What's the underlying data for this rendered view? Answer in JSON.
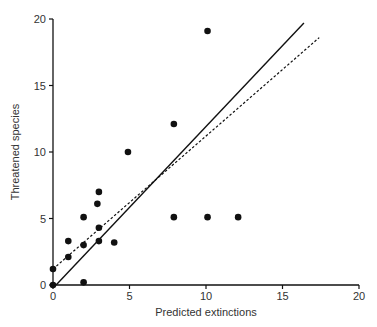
{
  "chart_data": {
    "type": "scatter",
    "title": "",
    "xlabel": "Predicted extinctions",
    "ylabel": "Threatened species",
    "xlim": [
      0,
      20
    ],
    "ylim": [
      0,
      20
    ],
    "xticks": [
      0,
      5,
      10,
      15,
      20
    ],
    "yticks": [
      0,
      5,
      10,
      15,
      20
    ],
    "grid": false,
    "legend": null,
    "points": [
      {
        "x": 0,
        "y": 0
      },
      {
        "x": 0,
        "y": 1.2
      },
      {
        "x": 2,
        "y": 0.2
      },
      {
        "x": 1,
        "y": 2.1
      },
      {
        "x": 1,
        "y": 3.3
      },
      {
        "x": 2,
        "y": 3.0
      },
      {
        "x": 2,
        "y": 5.1
      },
      {
        "x": 3,
        "y": 3.3
      },
      {
        "x": 3,
        "y": 4.3
      },
      {
        "x": 2.9,
        "y": 6.1
      },
      {
        "x": 3,
        "y": 7.0
      },
      {
        "x": 4,
        "y": 3.2
      },
      {
        "x": 4.9,
        "y": 10.0
      },
      {
        "x": 7.9,
        "y": 12.1
      },
      {
        "x": 7.9,
        "y": 5.1
      },
      {
        "x": 10.1,
        "y": 5.1
      },
      {
        "x": 12.1,
        "y": 5.1
      },
      {
        "x": 10.1,
        "y": 19.1
      }
    ],
    "lines": [
      {
        "name": "solid-fit",
        "style": "solid",
        "x": [
          0.2,
          16.4
        ],
        "y": [
          0,
          19.7
        ]
      },
      {
        "name": "dashed-fit",
        "style": "dashed",
        "x": [
          0,
          17.4
        ],
        "y": [
          1.2,
          18.6
        ]
      }
    ]
  },
  "colors": {
    "axis": "#111111",
    "points": "#111111",
    "text": "#333333"
  }
}
